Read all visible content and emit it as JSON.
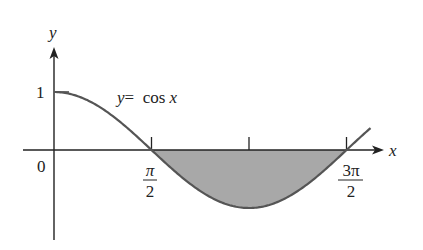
{
  "chart_data": {
    "type": "line",
    "title": "",
    "function_label": "y =  cos x",
    "function_label_var": "y",
    "function_label_eq": "=  cos ",
    "function_label_x": "x",
    "xlabel": "x",
    "ylabel": "y",
    "x_ticks": [
      {
        "value": 0,
        "label": "0"
      },
      {
        "value": 1.5708,
        "label_num": "π",
        "label_den": "2"
      },
      {
        "value": 3.1416,
        "label": ""
      },
      {
        "value": 4.7124,
        "label_num": "3π",
        "label_den": "2"
      }
    ],
    "y_ticks": [
      {
        "value": 1,
        "label": "1"
      }
    ],
    "xlim": [
      -0.49,
      5.14
    ],
    "ylim": [
      -1.5,
      1.75
    ],
    "curve": {
      "function": "cos",
      "x_start": 0,
      "x_end": 5.1
    },
    "shaded_region": {
      "from": 1.5708,
      "to": 4.7124,
      "between": "y = cos x and x-axis"
    },
    "colors": {
      "curve": "#555555",
      "fill": "#a8a8a8",
      "axis": "#222222"
    }
  }
}
